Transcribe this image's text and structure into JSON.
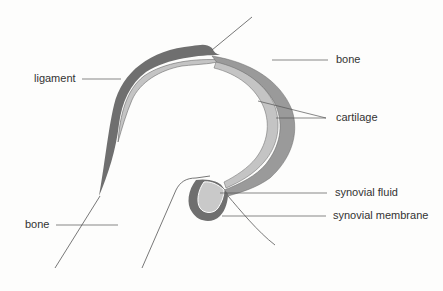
{
  "diagram": {
    "title": "",
    "labels": {
      "ligament": "ligament",
      "bone_top": "bone",
      "cartilage": "cartilage",
      "synovial_fluid": "synovial fluid",
      "synovial_membrane": "synovial membrane",
      "bone_bottom": "bone"
    },
    "colors": {
      "background": "#fdfdfc",
      "ligament": "#6f6f6f",
      "outer_cartilage": "#9a9a9a",
      "inner_cartilage": "#c4c4c4",
      "synovial_fluid": "#c9c9c9",
      "synovial_membrane": "#6f6f6f",
      "line": "#555555",
      "text": "#333333"
    }
  }
}
